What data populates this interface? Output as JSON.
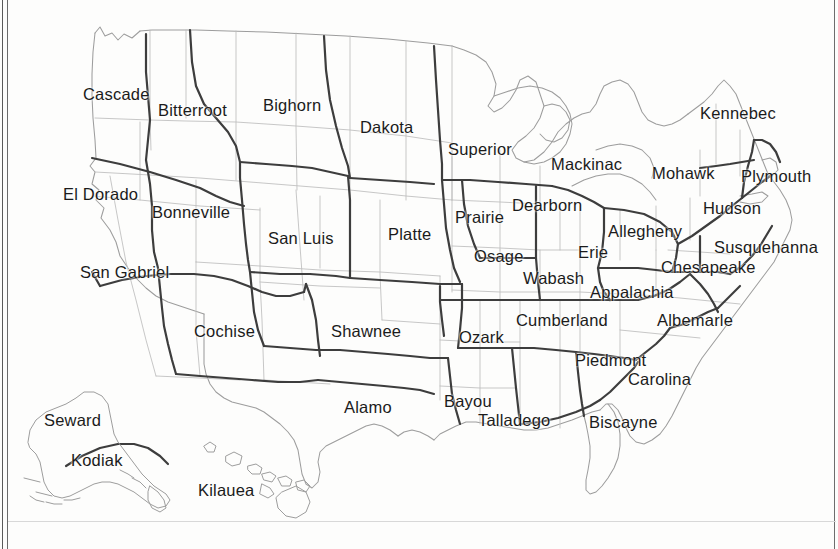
{
  "map": {
    "title": "United States Regional District Map",
    "background_color": "#fdfdfc",
    "outline_color": "#9a9a9a",
    "state_border_color": "#b4b4b4",
    "district_border_color": "#4a4a4a",
    "label_color": "#1b1b1b",
    "frame_color": "#5a5a5a"
  },
  "regions": [
    {
      "name": "Cascade",
      "x": 83,
      "y": 86,
      "area": "pacific-northwest"
    },
    {
      "name": "Bitterroot",
      "x": 158,
      "y": 102,
      "area": "northern-rockies"
    },
    {
      "name": "Bighorn",
      "x": 263,
      "y": 97,
      "area": "northern-plains-west"
    },
    {
      "name": "Dakota",
      "x": 360,
      "y": 119,
      "area": "northern-plains"
    },
    {
      "name": "Superior",
      "x": 448,
      "y": 141,
      "area": "upper-midwest"
    },
    {
      "name": "Mackinac",
      "x": 551,
      "y": 156,
      "area": "great-lakes"
    },
    {
      "name": "Kennebec",
      "x": 700,
      "y": 105,
      "area": "northern-new-england"
    },
    {
      "name": "Mohawk",
      "x": 652,
      "y": 165,
      "area": "upstate-new-york"
    },
    {
      "name": "Plymouth",
      "x": 741,
      "y": 168,
      "area": "southern-new-england"
    },
    {
      "name": "El Dorado",
      "x": 63,
      "y": 186,
      "area": "northern-california"
    },
    {
      "name": "Bonneville",
      "x": 152,
      "y": 204,
      "area": "great-basin"
    },
    {
      "name": "Prairie",
      "x": 455,
      "y": 209,
      "area": "iowa"
    },
    {
      "name": "Dearborn",
      "x": 512,
      "y": 197,
      "area": "michigan-south"
    },
    {
      "name": "Hudson",
      "x": 703,
      "y": 200,
      "area": "hudson-valley"
    },
    {
      "name": "Allegheny",
      "x": 608,
      "y": 223,
      "area": "western-pennsylvania"
    },
    {
      "name": "Susquehanna",
      "x": 714,
      "y": 239,
      "area": "eastern-pennsylvania"
    },
    {
      "name": "Platte",
      "x": 388,
      "y": 226,
      "area": "central-plains"
    },
    {
      "name": "San Luis",
      "x": 268,
      "y": 230,
      "area": "colorado"
    },
    {
      "name": "Osage",
      "x": 474,
      "y": 248,
      "area": "missouri"
    },
    {
      "name": "Erie",
      "x": 578,
      "y": 244,
      "area": "ohio"
    },
    {
      "name": "Wabash",
      "x": 523,
      "y": 270,
      "area": "indiana"
    },
    {
      "name": "Chesapeake",
      "x": 661,
      "y": 259,
      "area": "maryland-virginia"
    },
    {
      "name": "San Gabriel",
      "x": 80,
      "y": 264,
      "area": "southern-california"
    },
    {
      "name": "Appalachia",
      "x": 590,
      "y": 284,
      "area": "west-virginia"
    },
    {
      "name": "Cochise",
      "x": 194,
      "y": 323,
      "area": "arizona-new-mexico"
    },
    {
      "name": "Shawnee",
      "x": 331,
      "y": 323,
      "area": "oklahoma"
    },
    {
      "name": "Ozark",
      "x": 459,
      "y": 329,
      "area": "arkansas"
    },
    {
      "name": "Cumberland",
      "x": 516,
      "y": 312,
      "area": "tennessee-kentucky"
    },
    {
      "name": "Albemarle",
      "x": 657,
      "y": 312,
      "area": "north-carolina"
    },
    {
      "name": "Piedmont",
      "x": 575,
      "y": 352,
      "area": "georgia-upstate"
    },
    {
      "name": "Carolina",
      "x": 628,
      "y": 371,
      "area": "south-carolina"
    },
    {
      "name": "Alamo",
      "x": 344,
      "y": 399,
      "area": "texas"
    },
    {
      "name": "Bayou",
      "x": 444,
      "y": 393,
      "area": "louisiana"
    },
    {
      "name": "Talladego",
      "x": 478,
      "y": 412,
      "area": "alabama-mississippi"
    },
    {
      "name": "Biscayne",
      "x": 589,
      "y": 414,
      "area": "florida"
    },
    {
      "name": "Seward",
      "x": 44,
      "y": 412,
      "area": "alaska-mainland"
    },
    {
      "name": "Kodiak",
      "x": 71,
      "y": 452,
      "area": "alaska-south"
    },
    {
      "name": "Kilauea",
      "x": 198,
      "y": 482,
      "area": "hawaii"
    }
  ],
  "counts": {
    "region_total": 38
  }
}
